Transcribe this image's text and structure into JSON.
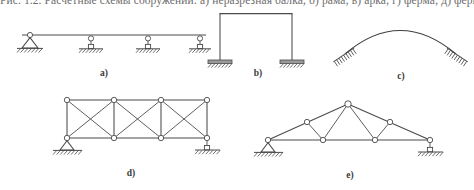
{
  "page": {
    "width": 474,
    "height": 190,
    "background": "#ffffff",
    "line_color": "#4a4a4a",
    "node_fill": "#ffffff",
    "label_color": "#3a3a3a",
    "clipped_header_text": "Рис. 1.2. Расчётные схемы сооружений: а) неразрезная балка; б) рама; в) арка; г) ферма; д) ферма"
  },
  "figure": {
    "labels": [
      {
        "id": "a",
        "text": "a)",
        "x": 104,
        "y": 76
      },
      {
        "id": "b",
        "text": "b)",
        "x": 258,
        "y": 76
      },
      {
        "id": "c",
        "text": "c)",
        "x": 401,
        "y": 79
      },
      {
        "id": "d",
        "text": "d)",
        "x": 131,
        "y": 176
      },
      {
        "id": "e",
        "text": "e)",
        "x": 350,
        "y": 178
      }
    ],
    "diagrams": [
      {
        "id": "a",
        "name": "continuous-beam",
        "caption": "a)",
        "description": "Continuous beam on one pin support and three roller supports",
        "beam": {
          "x1": 22,
          "y1": 35,
          "x2": 206,
          "y2": 35
        },
        "supports": [
          {
            "type": "pin",
            "x": 30,
            "y": 35
          },
          {
            "type": "roller",
            "x": 91,
            "y": 35
          },
          {
            "type": "roller",
            "x": 148,
            "y": 35
          },
          {
            "type": "roller",
            "x": 200,
            "y": 35
          }
        ]
      },
      {
        "id": "b",
        "name": "portal-frame",
        "caption": "b)",
        "description": "Rigid portal frame with two fixed base supports",
        "columns": [
          {
            "x": 220,
            "y_top": 14,
            "y_bottom": 60
          },
          {
            "x": 292,
            "y_top": 14,
            "y_bottom": 60
          }
        ],
        "beam": {
          "x1": 220,
          "y1": 14,
          "x2": 292,
          "y2": 14
        },
        "supports": [
          {
            "type": "fixed",
            "x": 220,
            "y": 60
          },
          {
            "type": "fixed",
            "x": 292,
            "y": 60
          }
        ]
      },
      {
        "id": "c",
        "name": "arch",
        "caption": "c)",
        "description": "Two-hinged arch on inclined fixed supports",
        "arch": {
          "x1": 345,
          "y1": 54,
          "x2": 456,
          "y2": 54,
          "apex_x": 400,
          "apex_y": 22
        },
        "supports": [
          {
            "type": "fixed-inclined",
            "x": 345,
            "y": 54,
            "angle": -32
          },
          {
            "type": "fixed-inclined",
            "x": 456,
            "y": 54,
            "angle": 32
          }
        ]
      },
      {
        "id": "d",
        "name": "parallel-chord-truss",
        "caption": "d)",
        "description": "Three-panel parallel chord truss with cross bracing, pin support left, roller support right",
        "top_chord_y": 100,
        "bottom_chord_y": 138,
        "panel_x": [
          67,
          114,
          161,
          207
        ],
        "supports": [
          {
            "type": "pin",
            "x": 67,
            "y": 138
          },
          {
            "type": "roller",
            "x": 207,
            "y": 138
          }
        ]
      },
      {
        "id": "e",
        "name": "roof-truss",
        "caption": "e)",
        "description": "Triangular Fink roof truss, pin support left, roller support right",
        "nodes": {
          "left": {
            "x": 268,
            "y": 140
          },
          "apex": {
            "x": 348,
            "y": 104
          },
          "right": {
            "x": 430,
            "y": 140
          },
          "top_left": {
            "x": 307,
            "y": 122
          },
          "top_right": {
            "x": 390,
            "y": 122
          },
          "bottom_left": {
            "x": 323,
            "y": 140
          },
          "bottom_right": {
            "x": 375,
            "y": 140
          }
        },
        "supports": [
          {
            "type": "pin",
            "x": 268,
            "y": 140
          },
          {
            "type": "roller",
            "x": 430,
            "y": 140
          }
        ]
      }
    ]
  }
}
